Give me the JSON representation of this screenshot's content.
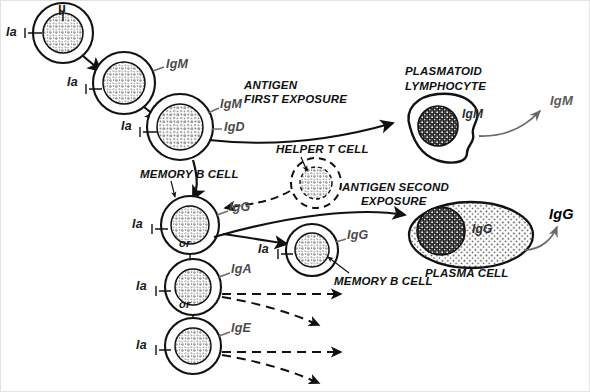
{
  "diagram": {
    "colors": {
      "ink": "#111111",
      "label_gray": "#4a4a4a",
      "output_gray": "#5a5a5a",
      "cytoplasm": "#ffffff",
      "nucleus_stipple": "#bdbdbd",
      "plasma_cell_fill": "#ffffff",
      "dark_nucleus": "#1c1c1c"
    }
  },
  "cells": [
    {
      "id": "stem-b-cell",
      "name": "pre-B cell with mu chain",
      "cx": 62,
      "cy": 32,
      "r": 30,
      "nucleus_r": 20,
      "ia_label": "Ia",
      "surface_label": "μ",
      "nucleus_style": "stipple"
    },
    {
      "id": "igm-b-cell",
      "name": "IgM-bearing B cell",
      "cx": 123,
      "cy": 82,
      "r": 31,
      "nucleus_r": 21,
      "ia_label": "Ia",
      "surface_label": "IgM",
      "nucleus_style": "stipple"
    },
    {
      "id": "igm-igd-b-cell",
      "name": "mature IgM/IgD B cell",
      "cx": 179,
      "cy": 126,
      "r": 33,
      "nucleus_r": 23,
      "ia_label": "Ia",
      "surface_label": "IgM",
      "surface_label_2": "IgD",
      "nucleus_style": "stipple"
    },
    {
      "id": "igg-memory-b-cell",
      "name": "IgG memory B cell",
      "cx": 189,
      "cy": 224,
      "r": 29,
      "nucleus_r": 19,
      "ia_label": "Ia",
      "surface_label": "IgG",
      "nucleus_style": "stipple"
    },
    {
      "id": "iga-b-cell",
      "name": "IgA-bearing B cell",
      "cx": 192,
      "cy": 286,
      "r": 28,
      "nucleus_r": 18,
      "ia_label": "Ia",
      "surface_label": "IgA",
      "nucleus_style": "stipple"
    },
    {
      "id": "ige-b-cell",
      "name": "IgE-bearing B cell",
      "cx": 192,
      "cy": 345,
      "r": 28,
      "nucleus_r": 18,
      "ia_label": "Ia",
      "surface_label": "IgE",
      "nucleus_style": "stipple"
    },
    {
      "id": "helper-t-cell",
      "name": "helper T cell",
      "cx": 315,
      "cy": 182,
      "r": 25,
      "nucleus_r": 16,
      "ia_label": "",
      "surface_label": "",
      "nucleus_style": "stipple-dashed"
    },
    {
      "id": "second-memory-b-cell",
      "name": "secondary memory B cell",
      "cx": 311,
      "cy": 249,
      "r": 26,
      "nucleus_r": 17,
      "ia_label": "Ia",
      "surface_label": "IgG",
      "nucleus_style": "stipple"
    }
  ],
  "effector_cells": [
    {
      "id": "plasmatoid-lymphocyte",
      "caption": "PLASMATOID\nLYMPHOCYTE",
      "caption_line1": "PLASMATOID",
      "caption_line2": "LYMPHOCYTE",
      "inner_label": "IgM",
      "output_label": "IgM",
      "output_bold": false
    },
    {
      "id": "plasma-cell",
      "caption": "PLASMA CELL",
      "inner_label": "IgG",
      "output_label": "IgG",
      "output_bold": true
    }
  ],
  "annotations": [
    {
      "id": "antigen-first-exposure",
      "line1": "ANTIGEN",
      "line2": "FIRST EXPOSURE",
      "x": 243,
      "y": 83
    },
    {
      "id": "helper-t-cell-caption",
      "line1": "HELPER T CELL",
      "line2": "",
      "x": 275,
      "y": 147
    },
    {
      "id": "antigen-second-exposure",
      "line1": "ANTIGEN SECOND",
      "line2": "EXPOSURE",
      "x": 341,
      "y": 185
    },
    {
      "id": "memory-b-cell-caption-1",
      "line1": "MEMORY B CELL",
      "line2": "",
      "x": 139,
      "y": 172
    },
    {
      "id": "memory-b-cell-caption-2",
      "line1": "MEMORY B CELL",
      "line2": "",
      "x": 333,
      "y": 279
    },
    {
      "id": "plasma-cell-caption",
      "line1": "PLASMA CELL",
      "line2": "",
      "x": 429,
      "y": 261
    },
    {
      "id": "plasmatoid-caption-line1",
      "line1": "PLASMATOID",
      "line2": "",
      "x": 404,
      "y": 70
    },
    {
      "id": "plasmatoid-caption-line2",
      "line1": "LYMPHOCYTE",
      "line2": "",
      "x": 404,
      "y": 84
    }
  ],
  "or_labels": [
    {
      "id": "or-label-iga",
      "text": "or",
      "x": 178,
      "y": 242
    },
    {
      "id": "or-label-ige",
      "text": "or",
      "x": 178,
      "y": 303
    }
  ],
  "outputs": [
    {
      "id": "igm-secretion",
      "text": "IgM",
      "x": 552,
      "y": 100,
      "bold": false
    },
    {
      "id": "igg-secretion",
      "text": "IgG",
      "x": 552,
      "y": 215,
      "bold": true
    }
  ],
  "surface_markers": {
    "ia": "Ia",
    "mu": "μ",
    "igm": "IgM",
    "igd": "IgD",
    "igg": "IgG",
    "iga": "IgA",
    "ige": "IgE"
  }
}
